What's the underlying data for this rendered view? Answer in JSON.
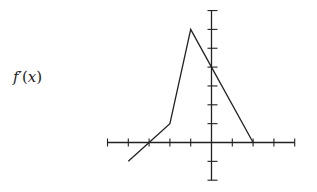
{
  "label": {
    "name": "f",
    "prime": "′",
    "open": "(",
    "var": "x",
    "close": ")"
  },
  "colors": {
    "axis": "#222222",
    "curve": "#222222",
    "background": "#ffffff"
  },
  "chart_data": {
    "type": "line",
    "title": "f′(x)",
    "xlabel": "",
    "ylabel": "f′(x)",
    "x": [
      -4,
      -3,
      -2,
      -1,
      0,
      2
    ],
    "series": [
      {
        "name": "f′(x)",
        "values": [
          -1,
          0,
          1,
          6,
          4,
          0
        ]
      }
    ],
    "xlim": [
      -5,
      4
    ],
    "ylim": [
      -2,
      7
    ],
    "x_ticks": [
      -5,
      -4,
      -3,
      -2,
      -1,
      0,
      1,
      2,
      3,
      4
    ],
    "y_ticks": [
      -2,
      -1,
      0,
      1,
      2,
      3,
      4,
      5,
      6,
      7
    ],
    "tick_labels_shown": false,
    "grid": false,
    "legend": "none",
    "annotations": [
      "piecewise linear graph of f′(x)"
    ]
  }
}
